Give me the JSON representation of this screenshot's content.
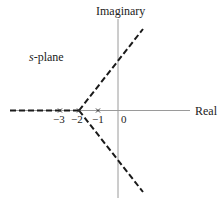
{
  "diagram": {
    "plane_label_var": "s",
    "plane_label_rest": "-plane",
    "axes": {
      "imag_label": "Imaginary",
      "real_label": "Real"
    },
    "ticks": [
      {
        "value": -3,
        "label": "−3"
      },
      {
        "value": -2,
        "label": "−2"
      },
      {
        "value": -1,
        "label": "−1"
      },
      {
        "value": 0,
        "label": "0"
      }
    ],
    "poles": [
      -3,
      -2,
      -1
    ],
    "breakaway_point": -2,
    "asymptote_angles_deg": [
      60,
      180,
      -60
    ],
    "colors": {
      "axis": "#9a9a9a",
      "locus": "#1a1a1a",
      "text": "#222222"
    }
  }
}
